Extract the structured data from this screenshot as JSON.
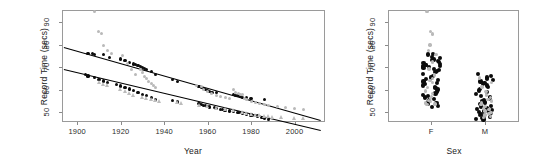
{
  "figure": {
    "title": "",
    "background": "#ffffff",
    "panel_count": 2
  },
  "colors": {
    "fit_line": "#000000",
    "solid_point": "#0b0b0b",
    "open_point": "#b9b9b9",
    "axis": "#9a9a9a",
    "text": "#1a1a1a"
  },
  "panels": [
    {
      "name": "record-time-vs-year",
      "xlabel": "Year",
      "ylabel": "Record Time (secs)",
      "xticks": [
        "1900",
        "1920",
        "1940",
        "1960",
        "1980",
        "2000"
      ],
      "yticks": [
        "50",
        "60",
        "70",
        "80",
        "90"
      ]
    },
    {
      "name": "record-time-by-sex",
      "xlabel": "Sex",
      "ylabel": "Record Time (secs)",
      "xticks": [
        "F",
        "M"
      ],
      "yticks": [
        "50",
        "60",
        "70",
        "80",
        "90"
      ]
    }
  ],
  "chart_data": [
    {
      "type": "scatter",
      "title": "",
      "xlabel": "Year",
      "ylabel": "Record Time (secs)",
      "xlim": [
        1893,
        2014
      ],
      "ylim": [
        45.5,
        95.5
      ],
      "xticks": [
        1900,
        1920,
        1940,
        1960,
        1980,
        2000
      ],
      "yticks": [
        50,
        60,
        70,
        80,
        90
      ],
      "grid": false,
      "legend": "none",
      "series": [
        {
          "name": "Female record (fitted)",
          "marker": "line",
          "color": "#000000",
          "line": {
            "x1": 1894,
            "y1": 79.2,
            "x2": 2012,
            "y2": 46.6
          }
        },
        {
          "name": "Male record (fitted)",
          "marker": "line",
          "color": "#000000",
          "line": {
            "x1": 1894,
            "y1": 69.3,
            "x2": 2012,
            "y2": 42.1
          }
        },
        {
          "name": "Female records (solid)",
          "marker": "filled-circle",
          "color": "#0b0b0b",
          "x": [
            1905,
            1907,
            1908,
            1912,
            1915,
            1920,
            1922,
            1924,
            1926,
            1927,
            1928,
            1929,
            1930,
            1931,
            1932,
            1934,
            1936,
            1944,
            1946,
            1956,
            1957,
            1958,
            1959,
            1960,
            1961,
            1962,
            1964,
            1972,
            1973,
            1974,
            1975,
            1976,
            1978,
            1980,
            1986
          ],
          "y": [
            76.0,
            76.0,
            75.6,
            75.6,
            74.4,
            73.6,
            73.0,
            72.2,
            71.4,
            71.0,
            70.8,
            70.4,
            70.0,
            69.4,
            69.0,
            68.0,
            66.6,
            64.4,
            63.6,
            61.2,
            60.8,
            60.4,
            60.0,
            59.6,
            59.0,
            58.8,
            58.6,
            57.8,
            57.4,
            57.2,
            56.8,
            56.6,
            56.4,
            56.0,
            55.6
          ]
        },
        {
          "name": "Male records (solid)",
          "marker": "filled-circle",
          "color": "#0b0b0b",
          "x": [
            1904,
            1905,
            1908,
            1910,
            1912,
            1914,
            1918,
            1920,
            1922,
            1924,
            1926,
            1928,
            1930,
            1932,
            1934,
            1936,
            1944,
            1946,
            1956,
            1957,
            1958,
            1959,
            1960,
            1961,
            1963,
            1964,
            1966,
            1967,
            1968,
            1970,
            1972,
            1974,
            1975,
            1976,
            1978,
            1980,
            1981,
            1983,
            1985,
            1986,
            1988
          ],
          "y": [
            66.8,
            66.0,
            65.4,
            64.6,
            63.8,
            63.0,
            62.2,
            61.6,
            61.0,
            60.2,
            59.4,
            58.6,
            57.8,
            57.2,
            56.4,
            55.6,
            55.0,
            54.4,
            53.8,
            53.4,
            53.0,
            52.8,
            52.4,
            52.2,
            51.8,
            51.6,
            51.2,
            51.0,
            50.8,
            50.4,
            50.2,
            49.8,
            49.6,
            49.4,
            49.0,
            48.6,
            48.4,
            48.2,
            47.6,
            47.2,
            46.6
          ]
        },
        {
          "name": "Other swims (open, grey)",
          "marker": "open-circle",
          "color": "#b9b9b9",
          "x": [
            1908,
            1910,
            1911,
            1912,
            1914,
            1916,
            1921,
            1923,
            1925,
            1927,
            1929,
            1930,
            1931,
            1932,
            1933,
            1934,
            1935,
            1936,
            1955,
            1957,
            1958,
            1960,
            1962,
            1964,
            1966,
            1968,
            1970,
            1972,
            1973,
            1974,
            1975,
            1976,
            1977,
            1978,
            1980,
            1982,
            1984,
            1986,
            1988,
            1992,
            1996,
            2000,
            2004
          ],
          "y": [
            94.8,
            86.0,
            84.8,
            79.8,
            77.6,
            76.0,
            75.0,
            71.4,
            69.0,
            66.6,
            68.8,
            67.6,
            66.0,
            64.8,
            63.6,
            62.8,
            61.8,
            60.8,
            62.0,
            61.2,
            60.2,
            59.0,
            58.2,
            57.4,
            57.0,
            56.4,
            56.0,
            59.8,
            58.8,
            58.4,
            58.0,
            57.6,
            56.2,
            55.4,
            54.8,
            54.4,
            53.8,
            53.2,
            52.8,
            52.2,
            51.8,
            51.4,
            51.2
          ]
        },
        {
          "name": "Other swims (grey triangles)",
          "marker": "triangle",
          "color": "#bcbcbc",
          "x": [
            1910,
            1912,
            1914,
            1920,
            1922,
            1924,
            1926,
            1930,
            1932,
            1934,
            1936,
            1938,
            1946,
            1948,
            1956,
            1960,
            1964,
            1968,
            1972,
            1976,
            1978,
            1980,
            1982,
            1984,
            1986,
            1988,
            1990,
            1994,
            2000,
            2004
          ],
          "y": [
            63.4,
            62.6,
            61.8,
            60.2,
            59.4,
            58.6,
            57.6,
            56.8,
            56.2,
            55.8,
            55.4,
            55.0,
            54.2,
            53.8,
            53.0,
            52.4,
            51.8,
            51.2,
            50.6,
            50.0,
            49.6,
            49.2,
            48.8,
            48.4,
            48.2,
            48.0,
            47.8,
            47.6,
            47.4,
            47.2
          ]
        }
      ]
    },
    {
      "type": "scatter",
      "title": "",
      "xlabel": "Sex",
      "ylabel": "Record Time (secs)",
      "categories": [
        "F",
        "M"
      ],
      "ylim": [
        45.5,
        95.5
      ],
      "yticks": [
        50,
        60,
        70,
        80,
        90
      ],
      "grid": false,
      "legend": "none",
      "series": [
        {
          "name": "F — record times (stripchart, jittered)",
          "category": "F",
          "marker": "filled-circle",
          "color": "#0b0b0b",
          "values": [
            76.0,
            75.6,
            74.6,
            74.0,
            73.4,
            73.0,
            72.6,
            72.2,
            71.8,
            71.4,
            71.0,
            70.8,
            70.6,
            70.4,
            70.2,
            70.0,
            69.6,
            69.2,
            68.8,
            68.4,
            68.0,
            66.8,
            66.0,
            65.4,
            64.8,
            64.2,
            63.6,
            63.0,
            62.4,
            61.8,
            61.2,
            60.6,
            60.0,
            59.4,
            58.8,
            58.2,
            57.6,
            57.0,
            56.4,
            55.8,
            55.2,
            54.6,
            54.0,
            53.4,
            52.8,
            52.2
          ]
        },
        {
          "name": "F — other swims (grey)",
          "category": "F",
          "marker": "open-circle",
          "color": "#b9b9b9",
          "values": [
            94.8,
            86.0,
            84.8,
            79.8,
            77.4,
            75.6,
            72.2,
            69.2,
            66.4,
            65.0,
            64.0,
            63.0,
            61.0,
            59.4,
            58.2,
            57.0,
            56.0,
            55.2,
            54.6,
            54.0,
            53.6,
            53.2
          ]
        },
        {
          "name": "M — record times (stripchart, jittered)",
          "category": "M",
          "marker": "filled-circle",
          "color": "#0b0b0b",
          "values": [
            66.8,
            66.0,
            65.4,
            64.8,
            64.2,
            63.6,
            63.0,
            62.4,
            61.8,
            61.2,
            60.4,
            59.6,
            58.8,
            58.0,
            57.2,
            56.6,
            56.0,
            55.4,
            54.8,
            54.2,
            53.6,
            53.0,
            52.6,
            52.2,
            51.8,
            51.4,
            51.0,
            50.6,
            50.2,
            49.8,
            49.4,
            49.0,
            48.6,
            48.2,
            47.8,
            47.4,
            47.0,
            46.6
          ]
        },
        {
          "name": "M — other swims (grey)",
          "category": "M",
          "marker": "open-circle",
          "color": "#b9b9b9",
          "values": [
            65.2,
            63.2,
            61.2,
            59.2,
            57.6,
            56.4,
            55.6,
            54.8,
            54.0,
            53.2,
            52.4,
            51.6,
            51.0,
            50.4,
            49.8,
            49.2,
            48.6,
            48.0,
            47.6
          ]
        }
      ]
    }
  ]
}
